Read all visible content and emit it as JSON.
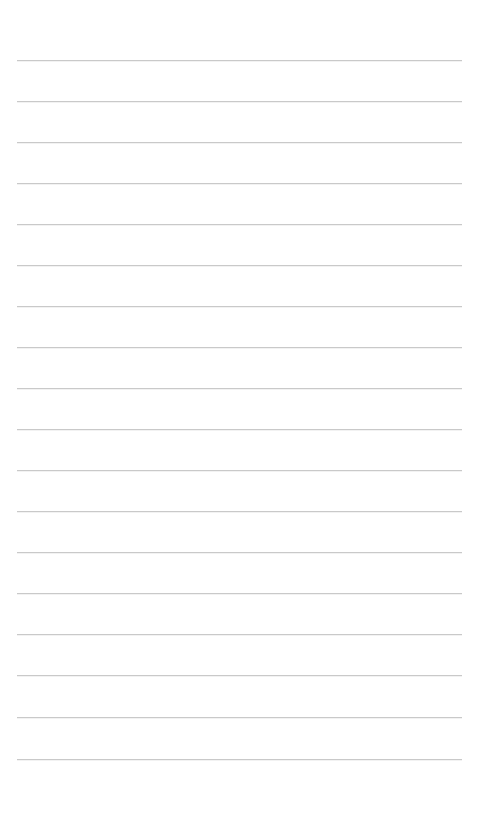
{
  "page": {
    "type": "blank-lined-paper",
    "background_color": "#ffffff",
    "line_color": "#c9c9c9",
    "line_left_x": 17,
    "line_right_x": 462,
    "line_count": 18,
    "line_positions_y": [
      60,
      101,
      142,
      183,
      224,
      265,
      306,
      347,
      388,
      429,
      470,
      511,
      552,
      593,
      634,
      675,
      717,
      759
    ]
  }
}
